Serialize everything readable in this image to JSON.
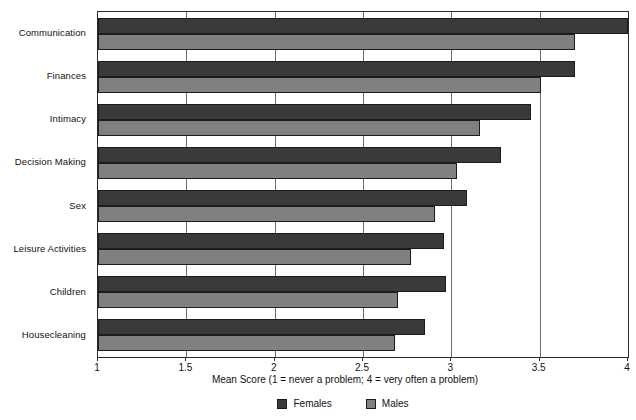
{
  "chart_data": {
    "type": "bar",
    "orientation": "horizontal",
    "title": "",
    "xlabel": "Mean Score (1 = never a problem; 4 = very often a problem)",
    "ylabel": "",
    "xlim": [
      1,
      4
    ],
    "xticks": [
      "1",
      "1.5",
      "2",
      "2.5",
      "3",
      "3.5",
      "4"
    ],
    "xtick_values": [
      1,
      1.5,
      2,
      2.5,
      3,
      3.5,
      4
    ],
    "grid": true,
    "grid_axis": "x",
    "legend_position": "bottom-center",
    "categories": [
      "Communication",
      "Finances",
      "Intimacy",
      "Decision Making",
      "Sex",
      "Leisure Activities",
      "Children",
      "Housecleaning"
    ],
    "series": [
      {
        "name": "Females",
        "color": "#3a3a3a",
        "values": [
          4.0,
          3.7,
          3.45,
          3.28,
          3.09,
          2.96,
          2.97,
          2.85
        ]
      },
      {
        "name": "Males",
        "color": "#808080",
        "values": [
          3.7,
          3.51,
          3.16,
          3.03,
          2.91,
          2.77,
          2.7,
          2.68
        ]
      }
    ]
  },
  "colors": {
    "females": "#3a3a3a",
    "males": "#808080",
    "axis": "#2b2b2b",
    "gridline": "#6b6b6b",
    "background": "#ffffff"
  }
}
